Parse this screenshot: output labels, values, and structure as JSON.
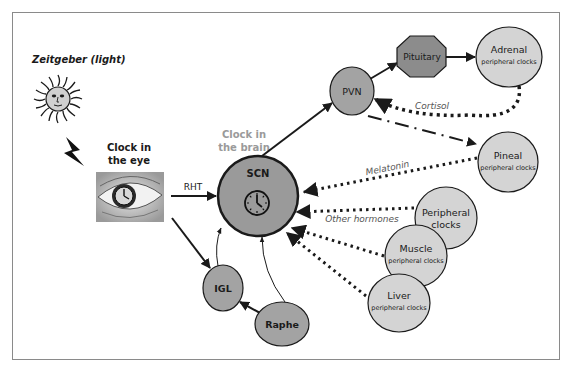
{
  "title": "Zeitgeber (light)",
  "colors": {
    "border": "#8a8a8a",
    "scn_fill": "#9a9a9a",
    "dark_node_fill": "#a3a3a3",
    "pituitary_fill": "#8c8c8c",
    "peripheral_fill": "#d4d4d4",
    "stroke": "#1a1a1a",
    "label_gray": "#9a9a9a",
    "hormone_label": "#555555"
  },
  "labels": {
    "zeitgeber": "Zeitgeber (light)",
    "clock_eye_line1": "Clock in",
    "clock_eye_line2": "the eye",
    "clock_brain_line1": "Clock in",
    "clock_brain_line2": "the brain",
    "rht": "RHT",
    "cortisol": "Cortisol",
    "melatonin": "Melatonin",
    "other_hormones": "Other hormones"
  },
  "nodes": {
    "scn": {
      "label": "SCN"
    },
    "pvn": {
      "label": "PVN"
    },
    "pituitary": {
      "label": "Pituitary"
    },
    "adrenal": {
      "label": "Adrenal",
      "sublabel": "peripheral clocks"
    },
    "pineal": {
      "label": "Pineal",
      "sublabel": "peripheral clocks"
    },
    "peripheral": {
      "label_line1": "Peripheral",
      "label_line2": "clocks"
    },
    "muscle": {
      "label": "Muscle",
      "sublabel": "peripheral clocks"
    },
    "liver": {
      "label": "Liver",
      "sublabel": "peripheral clocks"
    },
    "igl": {
      "label": "IGL"
    },
    "raphe": {
      "label": "Raphe"
    }
  },
  "icons": {
    "sun": "sun-face-icon",
    "lightning": "lightning-bolt-icon",
    "eye": "eye-clock-icon",
    "clock": "clock-icon"
  }
}
